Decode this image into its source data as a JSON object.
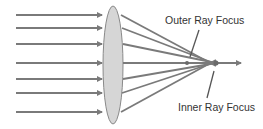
{
  "diagram": {
    "type": "spherical-aberration-lens",
    "labels": {
      "outer": "Outer Ray Focus",
      "inner": "Inner Ray Focus"
    },
    "colors": {
      "ray": "#7a7a7a",
      "lens_fill": "#d6d6d6",
      "lens_stroke": "#8a8a8a",
      "text": "#333333",
      "background": "#ffffff"
    },
    "incoming_rays_y": [
      15,
      28,
      44,
      63,
      79,
      93,
      112
    ],
    "lens": {
      "cx": 113,
      "cy": 65,
      "rx": 10,
      "ry": 59
    },
    "outer_focus": {
      "x": 187,
      "y": 63
    },
    "inner_focus": {
      "x": 216,
      "y": 63
    },
    "axis_arrow_end_x": 241
  }
}
